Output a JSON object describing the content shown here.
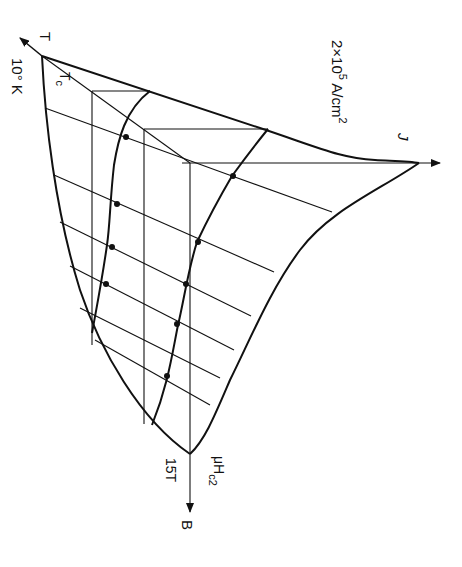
{
  "figure": {
    "colors": {
      "ink": "#111111",
      "background": "#ffffff"
    },
    "labels": {
      "t_axis": "T",
      "t_value": "10° K",
      "tc": "T",
      "tc_sub": "c",
      "j_axis": "J",
      "j_value_base": "2×10",
      "j_value_exp": "5",
      "j_value_unit": " A/cm",
      "j_value_unit_exp": "2",
      "b_axis": "B",
      "b_value": "15T",
      "hc2_mu": "μH",
      "hc2_sub": "c2"
    },
    "axes": [
      {
        "name": "T",
        "label": "T",
        "max_label": "10° K"
      },
      {
        "name": "J",
        "label": "J",
        "max_label": "2×10⁵ A/cm²"
      },
      {
        "name": "B",
        "label": "B",
        "max_label": "15T"
      }
    ],
    "curves": {
      "inner_curve_dots": 5,
      "outer_curve_dots": 5,
      "grid_lines_diagonal": 6,
      "grid_lines_vertical": 3
    }
  }
}
